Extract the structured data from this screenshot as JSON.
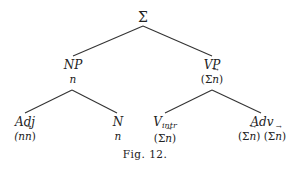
{
  "diagram": {
    "type": "tree",
    "root": {
      "label": "Σ"
    },
    "nodes": {
      "np": {
        "label": "NP",
        "annotation": "n"
      },
      "vp": {
        "label": "VP",
        "annotation_prefix": "(Σ",
        "annotation_vec": "n",
        "annotation_suffix": ")"
      },
      "adj": {
        "label": "Adj",
        "annotation_prefix": "(n",
        "annotation_vec": "n",
        "annotation_suffix": ")"
      },
      "n": {
        "label": "N",
        "annotation": "n"
      },
      "vintr": {
        "label": "V",
        "subscript": "intr",
        "annotation_prefix": "(Σ",
        "annotation_vec": "n",
        "annotation_suffix": ")"
      },
      "adv": {
        "label": "Adv",
        "annotation_prefix": "(Σ",
        "annotation_vec": "n",
        "annotation_mid": ") (Σ",
        "annotation_vec2": "n",
        "annotation_suffix": ")"
      }
    },
    "edges": [
      [
        "Σ",
        "NP"
      ],
      [
        "Σ",
        "VP"
      ],
      [
        "NP",
        "Adj"
      ],
      [
        "NP",
        "N"
      ],
      [
        "VP",
        "V_intr"
      ],
      [
        "VP",
        "Adv"
      ]
    ],
    "caption": "Fig. 12."
  }
}
